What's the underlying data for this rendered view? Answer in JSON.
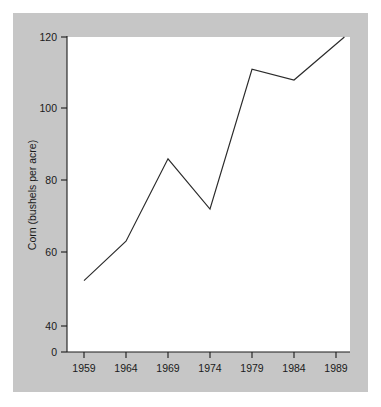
{
  "chart_data": {
    "type": "line",
    "title": "",
    "xlabel": "",
    "ylabel": "Corn (bushels per acre)",
    "x": [
      1959,
      1964,
      1969,
      1974,
      1979,
      1984,
      1990
    ],
    "values": [
      52,
      63,
      86,
      72,
      111,
      108,
      120
    ],
    "series": [
      {
        "name": "Corn yield",
        "values": [
          52,
          63,
          86,
          72,
          111,
          108,
          120
        ]
      }
    ],
    "xtick_labels": [
      "1959",
      "1964",
      "1969",
      "1974",
      "1979",
      "1984",
      "1989"
    ],
    "xtick_values": [
      1959,
      1964,
      1969,
      1974,
      1979,
      1984,
      1989
    ],
    "ytick_labels": [
      "0",
      "40",
      "60",
      "80",
      "100",
      "120"
    ],
    "ytick_values": [
      0,
      40,
      60,
      80,
      100,
      120
    ],
    "ylim": [
      0,
      122
    ],
    "xlim": [
      1957.5,
      1990.5
    ],
    "axis_break": true,
    "grid": false,
    "legend": "none",
    "line_color": "#2b2b2b",
    "panel_color": "#c6c6c6",
    "plot_background": "#ffffff"
  },
  "axis": {
    "y_title": "Corn (bushels per acre)",
    "y_ticks": [
      {
        "label": "120",
        "value": 120
      },
      {
        "label": "100",
        "value": 100
      },
      {
        "label": "80",
        "value": 80
      },
      {
        "label": "60",
        "value": 60
      },
      {
        "label": "40",
        "value": 40
      },
      {
        "label": "0",
        "value": 0
      }
    ],
    "x_ticks": [
      {
        "label": "1959",
        "value": 1959
      },
      {
        "label": "1964",
        "value": 1964
      },
      {
        "label": "1969",
        "value": 1969
      },
      {
        "label": "1974",
        "value": 1974
      },
      {
        "label": "1979",
        "value": 1979
      },
      {
        "label": "1984",
        "value": 1984
      },
      {
        "label": "1989",
        "value": 1989
      }
    ]
  }
}
